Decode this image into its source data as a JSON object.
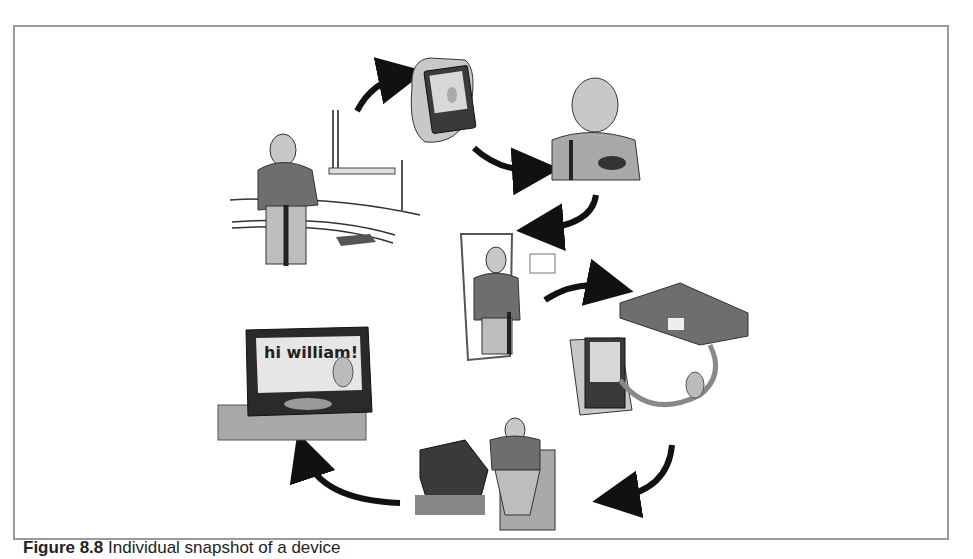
{
  "figure": {
    "caption_label": "Figure 8.8",
    "caption_text": "Individual snapshot of a device"
  },
  "scenes": [
    {
      "id": "scene-1",
      "description": "old man with cane walking past window and grate"
    },
    {
      "id": "scene-2",
      "description": "hand holding handheld device with character on screen"
    },
    {
      "id": "scene-3",
      "description": "man thinking, hand on chin, holding bowl"
    },
    {
      "id": "scene-4",
      "description": "man with cane standing in doorway, framed note on wall"
    },
    {
      "id": "scene-5",
      "description": "handheld device connected by cable to set-top box, small character"
    },
    {
      "id": "scene-6",
      "description": "man seated in armchair watching television"
    },
    {
      "id": "scene-7",
      "description": "television on stand showing greeting with character"
    }
  ],
  "tv_screen": {
    "greeting": "hi william!"
  },
  "colors": {
    "frame": "#9a9a9a",
    "arrow": "#111111",
    "sweater": "#6e6e6e",
    "pants": "#bdbdbd",
    "skin": "#c8c8c8",
    "dark": "#2a2a2a",
    "light_gray": "#a9a9a9"
  }
}
